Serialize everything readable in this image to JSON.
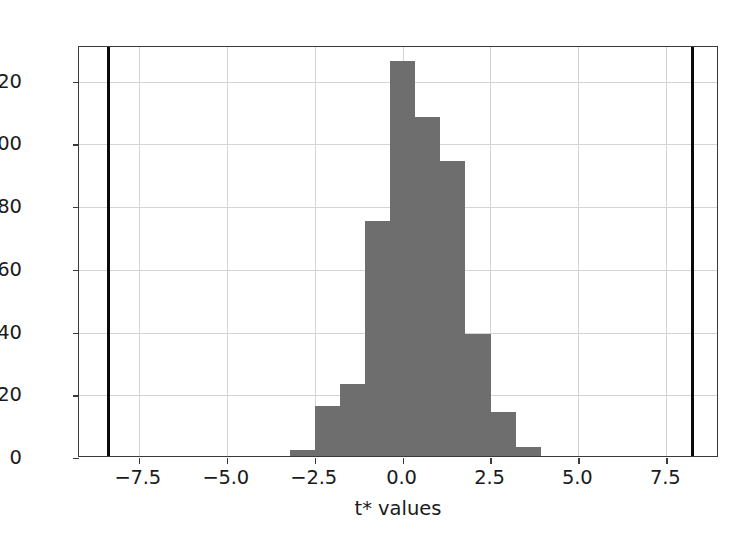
{
  "chart_data": {
    "type": "bar",
    "title": "",
    "xlabel": "t* values",
    "ylabel": "",
    "xlim": [
      -9.2,
      9.0
    ],
    "ylim": [
      0,
      131
    ],
    "grid": true,
    "legend": null,
    "bar_color": "#6e6e6e",
    "bin_width": 0.714,
    "categories": [
      "-3.21",
      "-2.50",
      "-1.79",
      "-1.07",
      "-0.36",
      "0.36",
      "1.07",
      "1.79",
      "2.50",
      "3.21"
    ],
    "bin_left_edges": [
      -3.21,
      -2.5,
      -1.79,
      -1.07,
      -0.36,
      0.36,
      1.07,
      1.79,
      2.5,
      3.21
    ],
    "values": [
      2,
      16,
      23,
      75,
      126,
      108,
      94,
      39,
      14,
      3
    ],
    "xticks": [
      -7.5,
      -5.0,
      -2.5,
      0.0,
      2.5,
      5.0,
      7.5
    ],
    "xticklabels": [
      "−7.5",
      "−5.0",
      "−2.5",
      "0.0",
      "2.5",
      "5.0",
      "7.5"
    ],
    "yticks": [
      0,
      20,
      40,
      60,
      80,
      100,
      120
    ],
    "yticklabels": [
      "0",
      "20",
      "40",
      "60",
      "80",
      "100",
      "120"
    ],
    "vlines": [
      {
        "name": "observed-t-negative",
        "x": -8.35,
        "color": "#0a0a0a"
      },
      {
        "name": "observed-t-positive",
        "x": 8.25,
        "color": "#0a0a0a"
      }
    ]
  }
}
